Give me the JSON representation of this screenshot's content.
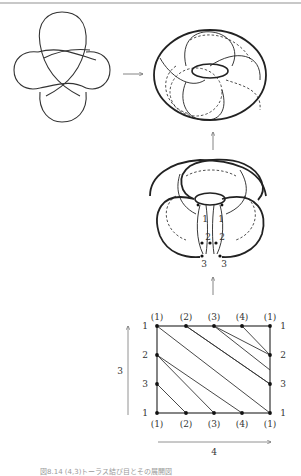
{
  "figure": {
    "caption": "図8.14  (4,3)トーラス結び目とその展開図",
    "stages": [
      "knot-diagram",
      "knot-on-torus",
      "cut-torus",
      "flat-rectangle"
    ]
  },
  "cut_torus": {
    "labels_left": [
      "1",
      "2",
      "3"
    ],
    "labels_right": [
      "1",
      "2",
      "3"
    ]
  },
  "grid": {
    "top_labels": [
      "(1)",
      "(2)",
      "(3)",
      "(4)",
      "(1)"
    ],
    "bottom_labels": [
      "(1)",
      "(2)",
      "(3)",
      "(4)",
      "(1)"
    ],
    "left_labels": [
      "1",
      "2",
      "3",
      "1"
    ],
    "right_labels": [
      "1",
      "2",
      "3",
      "1"
    ],
    "vertical_arrow_label": "3",
    "horizontal_arrow_label": "4"
  }
}
